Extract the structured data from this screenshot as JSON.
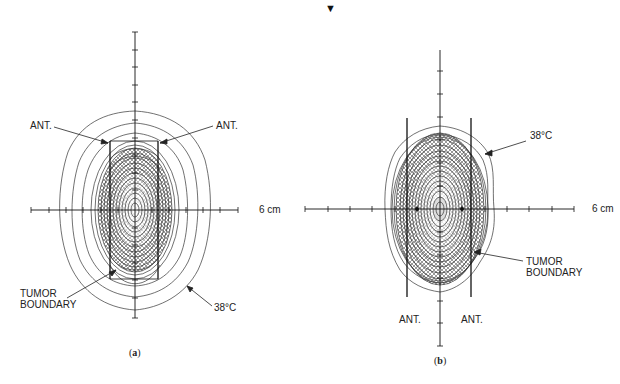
{
  "marker": "▼",
  "panel_a": {
    "caption_open": "(",
    "caption_letter": "a",
    "caption_close": ")",
    "labels": {
      "ant_left": "ANT.",
      "ant_right": "ANT.",
      "scale": "6 cm",
      "tumor_line1": "TUMOR",
      "tumor_line2": "BOUNDARY",
      "isotherm": "38°C"
    }
  },
  "panel_b": {
    "caption_open": "(",
    "caption_letter": "b",
    "caption_close": ")",
    "labels": {
      "ant_left": "ANT.",
      "ant_right": "ANT.",
      "scale": "6 cm",
      "tumor_line1": "TUMOR",
      "tumor_line2": "BOUNDARY",
      "isotherm": "38°C"
    }
  },
  "colors": {
    "ink": "#222222",
    "hatch": "#444444",
    "background": "#ffffff"
  }
}
